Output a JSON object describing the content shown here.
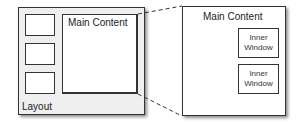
{
  "diagram": {
    "layout": {
      "label": "Layout",
      "sidebar_boxes": 3,
      "main_content_label": "Main Content"
    },
    "zoomed_view": {
      "title": "Main Content",
      "inner_windows": [
        {
          "line1": "Inner",
          "line2": "Window"
        },
        {
          "line1": "Inner",
          "line2": "Window"
        }
      ]
    },
    "colors": {
      "layout_background": "#efefef",
      "box_border": "#333333",
      "connector_line": "#333333"
    }
  }
}
